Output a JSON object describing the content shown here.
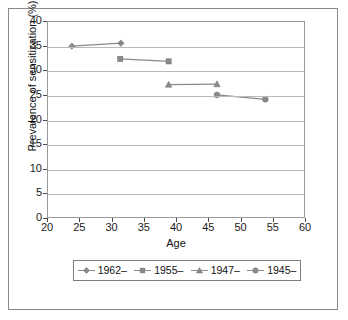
{
  "chart_data": {
    "type": "line",
    "title": "",
    "xlabel": "Age",
    "ylabel": "Prevalence of sensitization (%)",
    "xlim": [
      20,
      60
    ],
    "ylim": [
      0,
      40
    ],
    "xticks": [
      20,
      25,
      30,
      35,
      40,
      45,
      50,
      55,
      60
    ],
    "yticks": [
      0,
      5,
      10,
      15,
      20,
      25,
      30,
      35,
      40
    ],
    "grid": "horizontal",
    "legend_position": "bottom",
    "series": [
      {
        "name": "1962–",
        "marker": "diamond",
        "color": "#8a8a8a",
        "x": [
          23.7,
          31.3
        ],
        "y": [
          35.1,
          35.7
        ]
      },
      {
        "name": "1955–",
        "marker": "square",
        "color": "#8a8a8a",
        "x": [
          31.2,
          38.7
        ],
        "y": [
          32.5,
          32.0
        ]
      },
      {
        "name": "1947–",
        "marker": "triangle",
        "color": "#8a8a8a",
        "x": [
          38.7,
          46.2
        ],
        "y": [
          27.3,
          27.4
        ]
      },
      {
        "name": "1945–",
        "marker": "circle",
        "color": "#8a8a8a",
        "x": [
          46.2,
          53.7
        ],
        "y": [
          25.2,
          24.3
        ]
      }
    ]
  },
  "axis": {
    "y_tick_labels": [
      "40",
      "35",
      "30",
      "25",
      "20",
      "15",
      "10",
      "5",
      "0"
    ],
    "x_tick_labels": [
      "20",
      "25",
      "30",
      "35",
      "40",
      "45",
      "50",
      "55",
      "60"
    ],
    "y_title": "Prevalence of sensitization (%)",
    "x_title": "Age"
  },
  "legend": {
    "items": [
      {
        "label": "1962–",
        "marker": "diamond-marker-icon"
      },
      {
        "label": "1955–",
        "marker": "square-marker-icon"
      },
      {
        "label": "1947–",
        "marker": "triangle-marker-icon"
      },
      {
        "label": "1945–",
        "marker": "circle-marker-icon"
      }
    ]
  },
  "colors": {
    "series": "#8a8a8a",
    "gridline": "#b9b9b9",
    "axis": "#9a9a9a",
    "text": "#111111",
    "frame": "#8a8a8a"
  }
}
